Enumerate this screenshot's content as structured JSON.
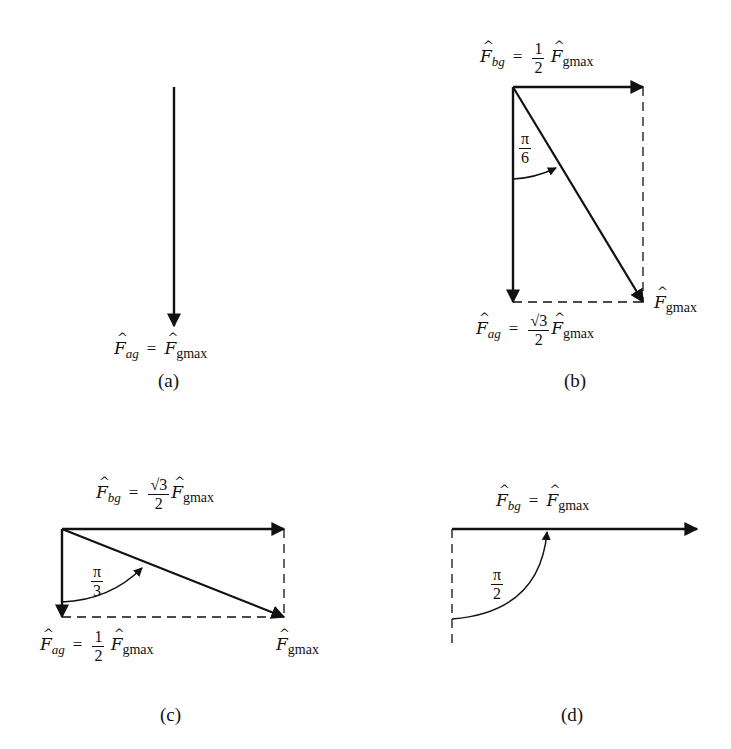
{
  "panels": [
    {
      "id": "a",
      "caption": "(a)",
      "ag_label": {
        "symbol": "F",
        "sub": "ag",
        "eq": "=",
        "coef": "",
        "rhs_sub": "gmax"
      },
      "bg_label": null,
      "resultant_label": null,
      "angle": null
    },
    {
      "id": "b",
      "caption": "(b)",
      "bg_label": {
        "symbol": "F",
        "sub": "bg",
        "eq": "=",
        "coef_num": "1",
        "coef_den": "2",
        "rhs_sub": "gmax"
      },
      "ag_label": {
        "symbol": "F",
        "sub": "ag",
        "eq": "=",
        "coef_num": "√3",
        "coef_den": "2",
        "rhs_sub": "gmax"
      },
      "resultant_label": {
        "symbol": "F",
        "sub": "gmax"
      },
      "angle": {
        "num": "π",
        "den": "6"
      }
    },
    {
      "id": "c",
      "caption": "(c)",
      "bg_label": {
        "symbol": "F",
        "sub": "bg",
        "eq": "=",
        "coef_num": "√3",
        "coef_den": "2",
        "rhs_sub": "gmax"
      },
      "ag_label": {
        "symbol": "F",
        "sub": "ag",
        "eq": "=",
        "coef_num": "1",
        "coef_den": "2",
        "rhs_sub": "gmax"
      },
      "resultant_label": {
        "symbol": "F",
        "sub": "gmax"
      },
      "angle": {
        "num": "π",
        "den": "3"
      }
    },
    {
      "id": "d",
      "caption": "(d)",
      "bg_label": {
        "symbol": "F",
        "sub": "bg",
        "eq": "=",
        "coef": "",
        "rhs_sub": "gmax"
      },
      "ag_label": null,
      "resultant_label": null,
      "angle": {
        "num": "π",
        "den": "2"
      }
    }
  ],
  "colors": {
    "ink": "#111111",
    "background": "#ffffff"
  }
}
